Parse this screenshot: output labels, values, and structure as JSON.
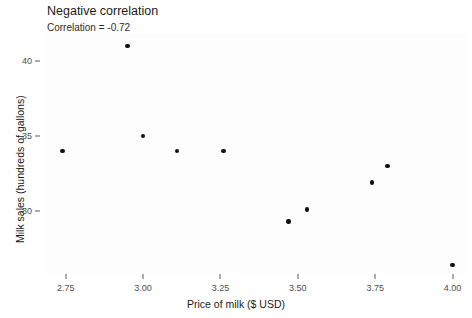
{
  "chart_data": {
    "type": "scatter",
    "title": "Negative correlation",
    "subtitle": "Correlation = -0.72",
    "xlabel": "Price of milk ($ USD)",
    "ylabel": "Milk sales (hundreds of gallons)",
    "xlim": [
      2.68,
      4.05
    ],
    "ylim": [
      25.8,
      41.8
    ],
    "grid": false,
    "legend": "none",
    "point_color": "#111111",
    "panel_background": "#fdfdfd",
    "xticks": [
      {
        "value": 2.75,
        "label": "2.75"
      },
      {
        "value": 3.0,
        "label": "3.00"
      },
      {
        "value": 3.25,
        "label": "3.25"
      },
      {
        "value": 3.5,
        "label": "3.50"
      },
      {
        "value": 3.75,
        "label": "3.75"
      },
      {
        "value": 4.0,
        "label": "4.00"
      }
    ],
    "yticks": [
      {
        "value": 30,
        "label": "30"
      },
      {
        "value": 35,
        "label": "35"
      },
      {
        "value": 40,
        "label": "40"
      }
    ],
    "x": [
      2.74,
      2.95,
      3.0,
      3.11,
      3.26,
      3.47,
      3.53,
      3.74,
      3.79,
      4.0
    ],
    "y": [
      34.0,
      41.0,
      35.0,
      34.0,
      34.0,
      29.3,
      30.1,
      31.9,
      33.0,
      26.4
    ],
    "points": [
      {
        "x": 2.74,
        "y": 34.0
      },
      {
        "x": 2.95,
        "y": 41.0
      },
      {
        "x": 3.0,
        "y": 35.0
      },
      {
        "x": 3.11,
        "y": 34.0
      },
      {
        "x": 3.26,
        "y": 34.0
      },
      {
        "x": 3.47,
        "y": 29.3
      },
      {
        "x": 3.53,
        "y": 30.1
      },
      {
        "x": 3.74,
        "y": 31.9
      },
      {
        "x": 3.79,
        "y": 33.0
      },
      {
        "x": 4.0,
        "y": 26.4
      }
    ]
  }
}
